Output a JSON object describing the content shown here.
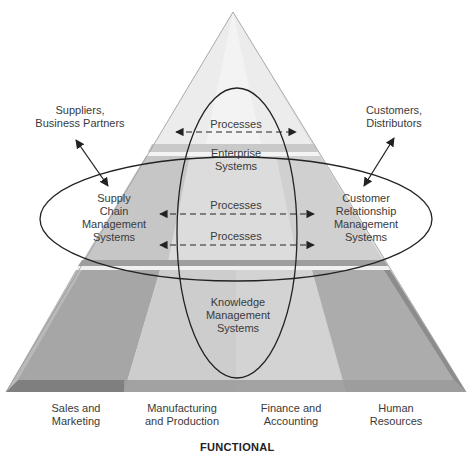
{
  "diagram": {
    "title": "FUNCTIONAL",
    "external": {
      "suppliers": "Suppliers,\nBusiness Partners",
      "customers": "Customers,\nDistributors"
    },
    "systems": {
      "scm": "Supply\nChain\nManagement\nSystems",
      "crm": "Customer\nRelationship\nManagement\nSystems",
      "enterprise": "Enterprise\nSystems",
      "kms": "Knowledge\nManagement\nSystems"
    },
    "processes": [
      {
        "label": "Processes"
      },
      {
        "label": "Processes"
      },
      {
        "label": "Processes"
      }
    ],
    "functional_areas": [
      {
        "label": "Sales and\nMarketing"
      },
      {
        "label": "Manufacturing\nand Production"
      },
      {
        "label": "Finance and\nAccounting"
      },
      {
        "label": "Human\nResources"
      }
    ],
    "colors": {
      "pyramid_light": "#e4e4e4",
      "pyramid_mid": "#cfcfcf",
      "pyramid_dark": "#a9a9a9",
      "pyramid_edge": "#8f8f8f",
      "line": "#222222",
      "text": "#3a3a3a"
    }
  }
}
